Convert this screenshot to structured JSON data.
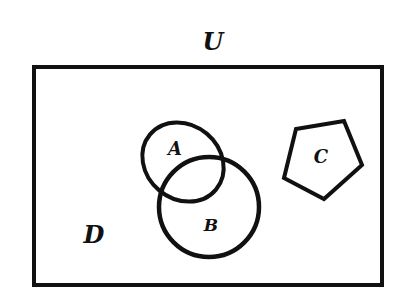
{
  "diagram": {
    "type": "venn",
    "universe_label": "U",
    "region_label": "D",
    "sets": [
      {
        "id": "A",
        "label": "A",
        "shape": "ellipse"
      },
      {
        "id": "B",
        "label": "B",
        "shape": "circle"
      },
      {
        "id": "C",
        "label": "C",
        "shape": "pentagon"
      }
    ],
    "relations": [
      "A overlaps B",
      "C disjoint from A and B"
    ],
    "colors": {
      "stroke": "#111111",
      "background": "#ffffff"
    }
  }
}
